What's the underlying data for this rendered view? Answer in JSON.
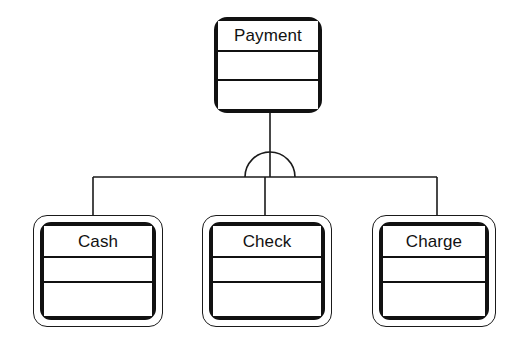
{
  "diagram": {
    "type": "uml-class-generalization",
    "notation": "generalization-set-arc",
    "background_color": "#ffffff",
    "line_color": "#1a1a1a",
    "text_color": "#111111"
  },
  "superclass": {
    "name": "Payment",
    "compartments": {
      "attributes": "",
      "operations": ""
    }
  },
  "subclasses": [
    {
      "name": "Cash",
      "compartments": {
        "attributes": "",
        "operations": ""
      }
    },
    {
      "name": "Check",
      "compartments": {
        "attributes": "",
        "operations": ""
      }
    },
    {
      "name": "Charge",
      "compartments": {
        "attributes": "",
        "operations": ""
      }
    }
  ],
  "connector": {
    "kind": "generalization-set",
    "symbol": "semicircle-arc",
    "label": ""
  }
}
